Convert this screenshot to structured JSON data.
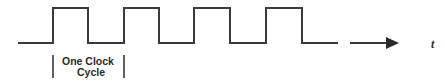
{
  "diagram": {
    "signal": {
      "type": "square-wave",
      "low_y": 43,
      "high_y": 8,
      "start_x": 18,
      "rising_edges_x": [
        53,
        124,
        194,
        266
      ],
      "falling_edges_x": [
        88,
        159,
        230,
        302
      ],
      "end_x": 338,
      "stroke_color": "#3a3a3a"
    },
    "time_axis": {
      "arrow_start_x": 350,
      "arrow_end_x": 399,
      "y": 43,
      "label": "t"
    },
    "cycle_marker": {
      "left_x": 53,
      "right_x": 124,
      "top_y": 55,
      "bottom_y": 78,
      "label_line1": "One Clock",
      "label_line2": "Cycle"
    }
  }
}
